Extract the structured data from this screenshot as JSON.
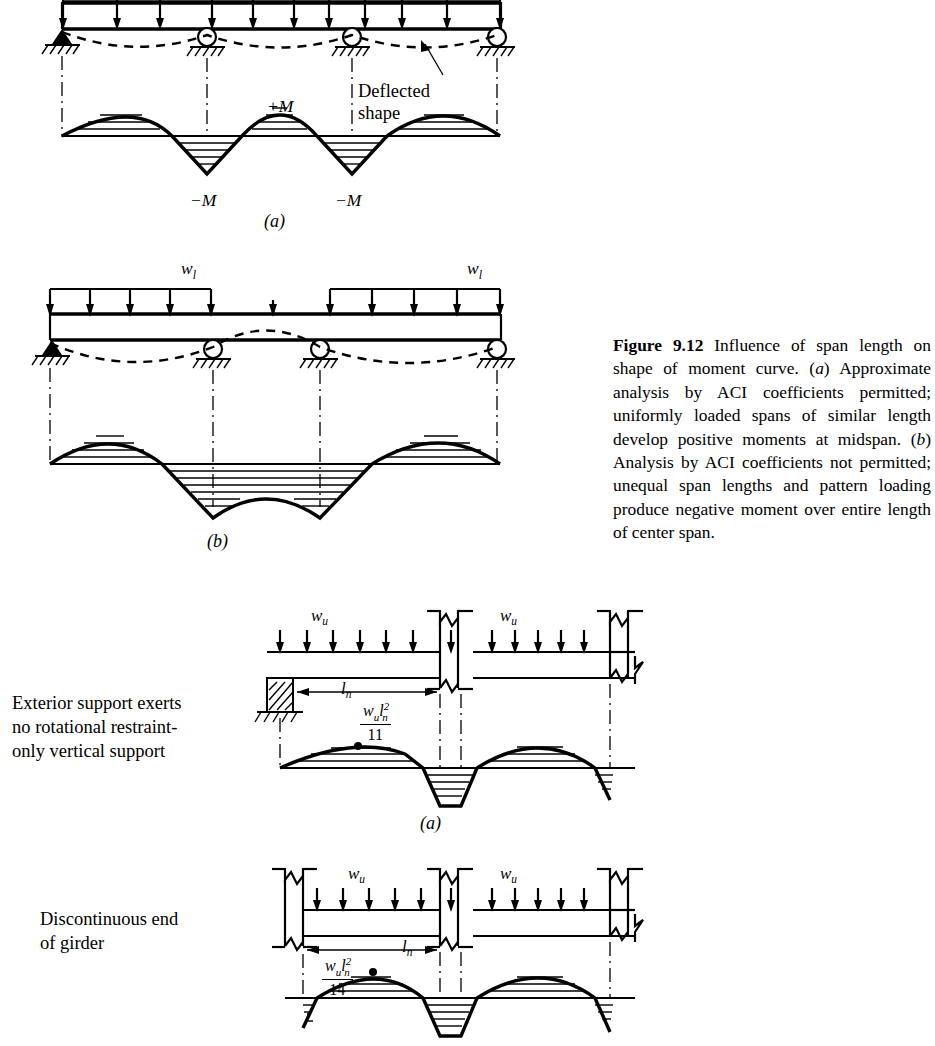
{
  "figure": {
    "number": "9.12",
    "label_prefix": "Figure",
    "caption_text": "Influence of span length on shape of moment curve. (a) Approximate analysis by ACI coefficients permitted; uniformly loaded spans of similar length develop positive moments at midspan. (b) Analysis by ACI coefficients not permitted; unequal span lengths and pattern loading produce negative moment over entire length of center span.",
    "caption_segments": {
      "s1": "Influence of span length on shape of moment curve. (",
      "a1": "a",
      "s2": ") Approximate analysis by ACI coefficients permitted; uniformly loaded spans of similar length develop positive moments at midspan. (",
      "b1": "b",
      "s3": ") Analysis by ACI coefficients not permitted; unequal span lengths and pattern loading produce negative moment over entire length of center span."
    }
  },
  "panels": {
    "top_a": {
      "sublabel": "(a)",
      "annotations": {
        "deflected_shape_line1": "Deflected",
        "deflected_shape_line2": "shape",
        "positive_moment": "+M",
        "negative_moment_left": "−M",
        "negative_moment_right": "−M"
      }
    },
    "mid_b": {
      "sublabel": "(b)",
      "annotations": {
        "load_left": "w",
        "load_left_sub": "l",
        "load_right": "w",
        "load_right_sub": "l"
      }
    },
    "lower_a": {
      "sublabel": "(a)",
      "side_note": "Exterior support exerts\nno rotational restraint-\nonly vertical support",
      "annotations": {
        "load_left": "w",
        "load_sub": "u",
        "load_right": "w",
        "span_label": "l",
        "span_sub": "n",
        "moment_numer_w": "w",
        "moment_numer_w_sub": "u",
        "moment_numer_l": "l",
        "moment_numer_l_sub": "n",
        "moment_numer_l_sup": "2",
        "moment_denominator": "11"
      }
    },
    "lower_b": {
      "side_note": "Discontinuous end\nof girder",
      "annotations": {
        "load_left": "w",
        "load_sub": "u",
        "load_right": "w",
        "span_label": "l",
        "span_sub": "n",
        "moment_numer_w": "w",
        "moment_numer_w_sub": "u",
        "moment_numer_l": "l",
        "moment_numer_l_sub": "n",
        "moment_numer_l_sup": "2",
        "moment_denominator": "14"
      }
    }
  },
  "colors": {
    "ink": "#000000",
    "paper": "#ffffff"
  }
}
